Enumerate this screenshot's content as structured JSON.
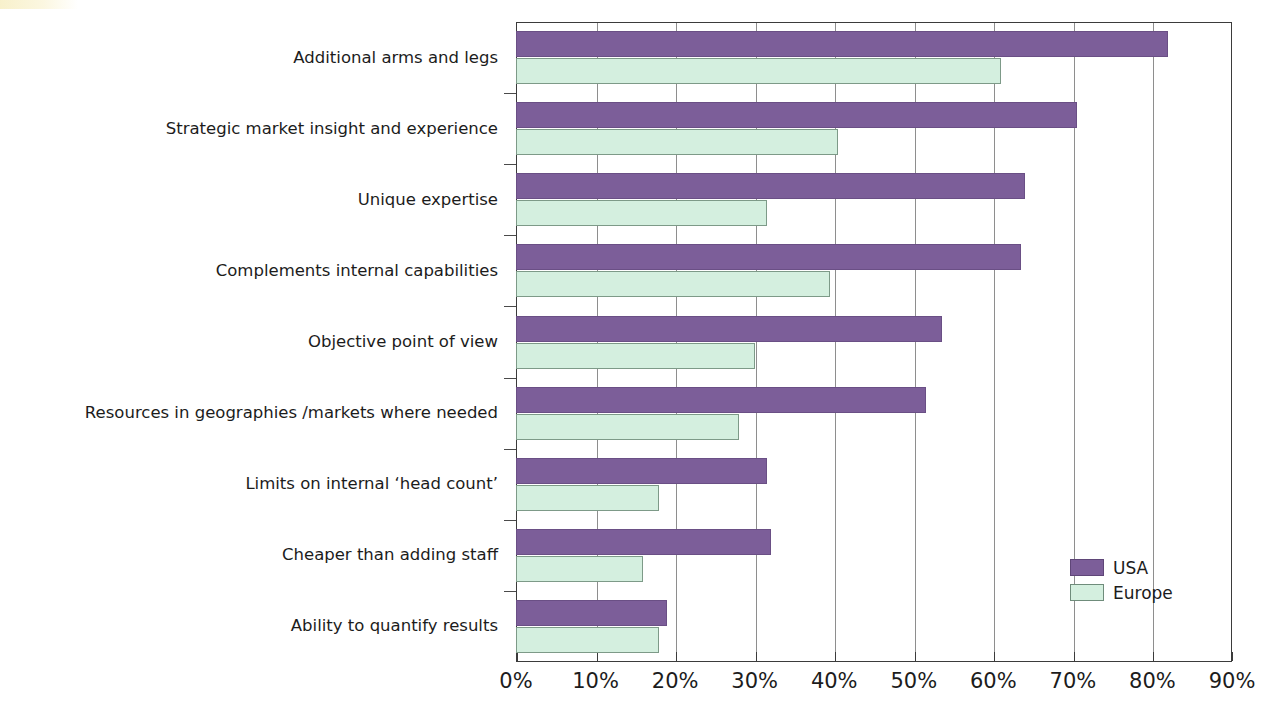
{
  "chart_data": {
    "type": "bar",
    "orientation": "horizontal",
    "title": "",
    "xlabel": "",
    "ylabel": "",
    "xlim": [
      0,
      90
    ],
    "xticks": [
      0,
      10,
      20,
      30,
      40,
      50,
      60,
      70,
      80,
      90
    ],
    "xtick_labels": [
      "0%",
      "10%",
      "20%",
      "30%",
      "40%",
      "50%",
      "60%",
      "70%",
      "80%",
      "90%"
    ],
    "grid": true,
    "grid_axis": "x",
    "legend_position": "bottom-right",
    "categories": [
      "Additional arms and legs",
      "Strategic market insight and experience",
      "Unique expertise",
      "Complements internal capabilities",
      "Objective point of view",
      "Resources in geographies /markets where needed",
      "Limits on internal ‘head count’",
      "Cheaper than adding staff",
      "Ability to quantify results"
    ],
    "series": [
      {
        "name": "USA",
        "color": "#7c5e99",
        "values": [
          82,
          70.5,
          64,
          63.5,
          53.5,
          51.5,
          31.5,
          32,
          19
        ]
      },
      {
        "name": "Europe",
        "color": "#d4efdf",
        "values": [
          61,
          40.5,
          31.5,
          39.5,
          30,
          28,
          18,
          16,
          18
        ]
      }
    ]
  },
  "legend": {
    "items": [
      {
        "label": "USA",
        "color": "#7c5e99"
      },
      {
        "label": "Europe",
        "color": "#d4efdf"
      }
    ]
  },
  "colors": {
    "usa": "#7c5e99",
    "europe": "#d4efdf",
    "axis": "#3b3b3b",
    "gridline": "#8e8e8e",
    "background": "#ffffff"
  }
}
